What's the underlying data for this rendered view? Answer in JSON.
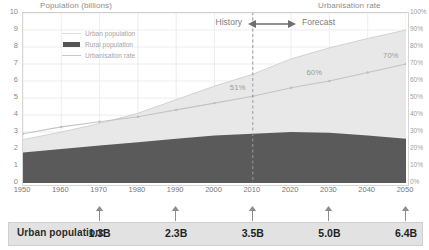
{
  "chart_data": {
    "type": "area",
    "title": "",
    "ylabel": "Population (billions)",
    "y2label": "Urbanisation rate",
    "xlabel": "",
    "ylim": [
      0,
      10
    ],
    "y2lim": [
      0,
      100
    ],
    "xlim": [
      1950,
      2050
    ],
    "grid": true,
    "legend_position": "top-left",
    "x": [
      1950,
      1960,
      1970,
      1980,
      1990,
      2000,
      2010,
      2020,
      2030,
      2040,
      2050
    ],
    "xticklabels": [
      "1950",
      "1960",
      "1970",
      "1980",
      "1990",
      "2000",
      "2010",
      "2020",
      "2030",
      "2040",
      "2050"
    ],
    "yticklabels": [
      "0",
      "1",
      "2",
      "3",
      "4",
      "5",
      "6",
      "7",
      "8",
      "9",
      "10"
    ],
    "y2ticklabels": [
      "0%",
      "10%",
      "20%",
      "30%",
      "40%",
      "50%",
      "60%",
      "70%",
      "80%",
      "90%",
      "100%"
    ],
    "series": [
      {
        "name": "Rural population",
        "type": "area",
        "color": "#5a5a5a",
        "values": [
          1.8,
          2.0,
          2.2,
          2.4,
          2.6,
          2.8,
          2.9,
          3.0,
          2.95,
          2.8,
          2.6
        ]
      },
      {
        "name": "Urban population",
        "type": "area",
        "color": "#e8e8e8",
        "values": [
          0.75,
          1.0,
          1.3,
          1.7,
          2.3,
          2.9,
          3.5,
          4.3,
          5.0,
          5.7,
          6.4
        ]
      },
      {
        "name": "Urbanisation rate",
        "type": "line",
        "axis": "right",
        "color": "#c4c4c4",
        "values": [
          29,
          33,
          36,
          39,
          43,
          47,
          51,
          56,
          60,
          65,
          70
        ]
      }
    ],
    "annotations": [
      {
        "label": "51%",
        "x": 2010,
        "value": 51
      },
      {
        "label": "60%",
        "x": 2030,
        "value": 60
      },
      {
        "label": "70%",
        "x": 2050,
        "value": 70
      }
    ],
    "markers": {
      "divider_year": 2010,
      "history_label": "History",
      "forecast_label": "Forecast"
    }
  },
  "axis": {
    "left_title": "Population (billions)",
    "right_title": "Urbanisation rate"
  },
  "legend": {
    "items": [
      {
        "label": "Urban population",
        "marker": "line-light"
      },
      {
        "label": "Rural population",
        "marker": "swatch-dark"
      },
      {
        "label": "Urbanisation rate",
        "marker": "line-rate"
      }
    ]
  },
  "band": {
    "history": "History",
    "forecast": "Forecast"
  },
  "footer": {
    "label": "Urban population:",
    "entries": [
      {
        "year": "1970",
        "value": "1.3B"
      },
      {
        "year": "1990",
        "value": "2.3B"
      },
      {
        "year": "2010",
        "value": "3.5B"
      },
      {
        "year": "2030",
        "value": "5.0B"
      },
      {
        "year": "2050",
        "value": "6.4B"
      }
    ]
  },
  "colors": {
    "rural": "#5a5a5a",
    "urban": "#e8e8e8",
    "rate_line": "#c4c4c4",
    "bar_bg": "#e2e2e2",
    "grid": "#e9e9e9"
  }
}
